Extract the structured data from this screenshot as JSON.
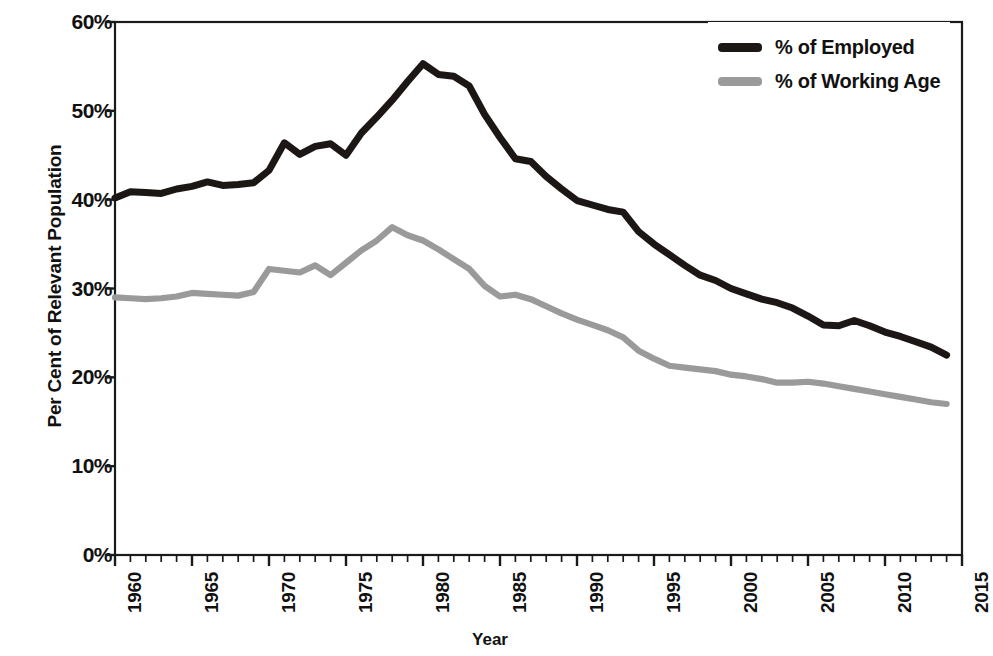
{
  "chart_data": {
    "type": "line",
    "title": "",
    "xlabel": "Year",
    "ylabel": "Per Cent of Relevant Population",
    "xlim": [
      1960,
      2015
    ],
    "ylim": [
      0,
      60
    ],
    "ytick_labels": [
      "0%",
      "10%",
      "20%",
      "30%",
      "40%",
      "50%",
      "60%"
    ],
    "ytick_values": [
      0,
      10,
      20,
      30,
      40,
      50,
      60
    ],
    "xtick_labels": [
      "1960",
      "1965",
      "1970",
      "1975",
      "1980",
      "1985",
      "1990",
      "1995",
      "2000",
      "2005",
      "2010",
      "2015"
    ],
    "xtick_values": [
      1960,
      1965,
      1970,
      1975,
      1980,
      1985,
      1990,
      1995,
      2000,
      2005,
      2010,
      2015
    ],
    "minor_xticks": true,
    "grid": false,
    "legend_position": "top-right",
    "x": [
      1960,
      1961,
      1962,
      1963,
      1964,
      1965,
      1966,
      1967,
      1968,
      1969,
      1970,
      1971,
      1972,
      1973,
      1974,
      1975,
      1976,
      1977,
      1978,
      1979,
      1980,
      1981,
      1982,
      1983,
      1984,
      1985,
      1986,
      1987,
      1988,
      1989,
      1990,
      1991,
      1992,
      1993,
      1994,
      1995,
      1996,
      1997,
      1998,
      1999,
      2000,
      2001,
      2002,
      2003,
      2004,
      2005,
      2006,
      2007,
      2008,
      2009,
      2010,
      2011,
      2012,
      2013,
      2014
    ],
    "series": [
      {
        "name": "% of Employed",
        "color": "#1c1714",
        "values": [
          40.2,
          40.9,
          40.8,
          40.7,
          41.2,
          41.5,
          42.0,
          41.6,
          41.7,
          41.9,
          43.3,
          46.4,
          45.1,
          46.0,
          46.3,
          45.0,
          47.5,
          49.3,
          51.2,
          53.3,
          55.3,
          54.1,
          53.9,
          52.8,
          49.6,
          47.0,
          44.6,
          44.3,
          42.6,
          41.2,
          39.9,
          39.4,
          38.9,
          38.6,
          36.4,
          35.0,
          33.8,
          32.6,
          31.5,
          30.9,
          30.0,
          29.4,
          28.8,
          28.4,
          27.8,
          26.9,
          25.9,
          25.8,
          26.4,
          25.8,
          25.1,
          24.6,
          24.0,
          23.4,
          22.5
        ]
      },
      {
        "name": "% of Working Age",
        "color": "#9a9a9a",
        "values": [
          29.0,
          28.9,
          28.8,
          28.9,
          29.1,
          29.5,
          29.4,
          29.3,
          29.2,
          29.6,
          32.2,
          32.0,
          31.8,
          32.6,
          31.5,
          32.9,
          34.3,
          35.4,
          36.9,
          36.0,
          35.4,
          34.4,
          33.3,
          32.2,
          30.3,
          29.1,
          29.3,
          28.8,
          28.0,
          27.2,
          26.5,
          25.9,
          25.3,
          24.5,
          23.0,
          22.1,
          21.3,
          21.1,
          20.9,
          20.7,
          20.3,
          20.1,
          19.8,
          19.4,
          19.4,
          19.5,
          19.3,
          19.0,
          18.7,
          18.4,
          18.1,
          17.8,
          17.5,
          17.2,
          17.0
        ]
      }
    ]
  },
  "legend": {
    "items": [
      {
        "label": "% of Employed",
        "color": "#1c1714"
      },
      {
        "label": "% of Working Age",
        "color": "#9a9a9a"
      }
    ]
  },
  "axes": {
    "x_title": "Year",
    "y_title": "Per Cent of Relevant Population"
  }
}
